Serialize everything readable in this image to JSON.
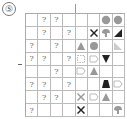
{
  "puzzle": {
    "number_label": "⑤",
    "rows": 8,
    "cols": 8,
    "cells": [
      [
        "",
        "?",
        "?",
        "",
        "",
        "",
        "flower-gray",
        "flower-gray"
      ],
      [
        "",
        "?",
        "",
        "?",
        "",
        "x-black",
        "swirl-gray",
        "triangle-right-black"
      ],
      [
        "?",
        "",
        "?",
        "",
        "bell-gray",
        "blob-gray",
        "",
        "triangle-right-light"
      ],
      [
        "?",
        "?",
        "",
        "?",
        "outline-dashed",
        "outline-shape",
        "triangle-down-black",
        ""
      ],
      [
        "",
        "",
        "?",
        "",
        "outline-shape",
        "triangle-up-gray",
        "",
        ""
      ],
      [
        "?",
        "?",
        "",
        "?",
        "",
        "",
        "trapezoid-black",
        "outline-shape"
      ],
      [
        "",
        "?",
        "?",
        "",
        "x-gray",
        "outline-shape",
        "triangle-up-gray",
        ""
      ],
      [
        "?",
        "",
        "",
        "",
        "x-black",
        "",
        "",
        "swirl-gray"
      ]
    ]
  },
  "colors": {
    "black": "#222222",
    "gray": "#999999",
    "light": "#cccccc",
    "outline": "#bbbbbb"
  }
}
